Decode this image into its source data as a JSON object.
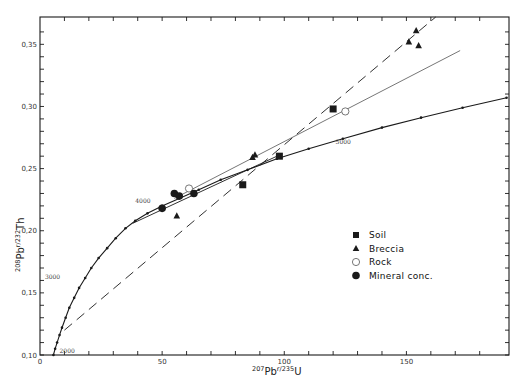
{
  "chart_data": {
    "type": "scatter",
    "title": "",
    "xlabel": "207Pb r/235U",
    "xlabel_parts": {
      "sup1": "207",
      "base1": "Pb",
      "sup2": "r",
      "sep": "/",
      "sup3": "235",
      "base2": "U"
    },
    "ylabel": "208Pb r/232Th",
    "ylabel_parts": {
      "sup1": "208",
      "base1": "Pb",
      "sup2": "r",
      "sep": "/",
      "sup3": "232",
      "base2": "Th"
    },
    "xlim": [
      0,
      192
    ],
    "ylim": [
      0.1,
      0.372
    ],
    "x_ticks": [
      0,
      10,
      20,
      30,
      40,
      50,
      60,
      70,
      80,
      90,
      100,
      110,
      120,
      130,
      140,
      150,
      160,
      170,
      180
    ],
    "x_tick_labels": [
      {
        "value": 0,
        "label": "0"
      },
      {
        "value": 50,
        "label": "50"
      },
      {
        "value": 100,
        "label": "100"
      },
      {
        "value": 150,
        "label": "150"
      }
    ],
    "y_ticks": [
      0.1,
      0.11,
      0.12,
      0.13,
      0.14,
      0.15,
      0.16,
      0.17,
      0.18,
      0.19,
      0.2,
      0.21,
      0.22,
      0.23,
      0.24,
      0.25,
      0.26,
      0.27,
      0.28,
      0.29,
      0.3,
      0.31,
      0.32,
      0.33,
      0.34,
      0.35,
      0.36
    ],
    "y_tick_labels": [
      {
        "value": 0.1,
        "label": "0,10"
      },
      {
        "value": 0.15,
        "label": "0,15"
      },
      {
        "value": 0.2,
        "label": "0,20"
      },
      {
        "value": 0.25,
        "label": "0,25"
      },
      {
        "value": 0.3,
        "label": "0,30"
      },
      {
        "value": 0.35,
        "label": "0,35"
      }
    ],
    "grid": false,
    "legend_position": "right-center",
    "series": [
      {
        "name": "Soil",
        "marker": "filled-square",
        "points": [
          [
            83,
            0.237
          ],
          [
            98,
            0.26
          ],
          [
            120,
            0.298
          ]
        ]
      },
      {
        "name": "Breccia",
        "marker": "filled-triangle",
        "points": [
          [
            151,
            0.352
          ],
          [
            154,
            0.361
          ],
          [
            155,
            0.349
          ],
          [
            87,
            0.259
          ],
          [
            88,
            0.261
          ],
          [
            56,
            0.212
          ]
        ]
      },
      {
        "name": "Rock",
        "marker": "open-circle",
        "points": [
          [
            125,
            0.296
          ],
          [
            61,
            0.234
          ]
        ]
      },
      {
        "name": "Mineral conc.",
        "marker": "filled-circle",
        "points": [
          [
            50,
            0.218
          ],
          [
            55,
            0.23
          ],
          [
            63,
            0.23
          ],
          [
            57,
            0.228
          ]
        ]
      }
    ],
    "concordia": {
      "name": "Concordia curve",
      "style": "solid-with-dots",
      "points": [
        [
          5.5,
          0.1
        ],
        [
          6.2,
          0.105
        ],
        [
          7,
          0.11
        ],
        [
          8,
          0.116
        ],
        [
          9,
          0.122
        ],
        [
          10.5,
          0.13
        ],
        [
          12,
          0.138
        ],
        [
          14,
          0.146
        ],
        [
          16,
          0.154
        ],
        [
          18.5,
          0.162
        ],
        [
          21,
          0.17
        ],
        [
          24,
          0.178
        ],
        [
          27.5,
          0.186
        ],
        [
          31,
          0.194
        ],
        [
          35,
          0.202
        ],
        [
          39,
          0.208
        ],
        [
          44,
          0.214
        ],
        [
          50,
          0.22
        ],
        [
          57,
          0.226
        ],
        [
          65,
          0.233
        ],
        [
          74,
          0.241
        ],
        [
          85,
          0.249
        ],
        [
          97,
          0.258
        ],
        [
          110,
          0.266
        ],
        [
          124,
          0.274
        ],
        [
          140,
          0.283
        ],
        [
          156,
          0.291
        ],
        [
          173,
          0.299
        ],
        [
          191,
          0.307
        ]
      ],
      "age_labels": [
        {
          "label": "2000",
          "x": 8,
          "y": 0.102
        },
        {
          "label": "3000",
          "x": 2,
          "y": 0.161
        },
        {
          "label": "4000",
          "x": 39,
          "y": 0.222
        },
        {
          "label": "5000",
          "x": 121,
          "y": 0.27
        }
      ]
    },
    "fit_lines": [
      {
        "name": "Dashed line (Soil/Breccia)",
        "style": "long-dash",
        "from": [
          10,
          0.12
        ],
        "to": [
          162,
          0.372
        ]
      },
      {
        "name": "Thin line (Rock)",
        "style": "solid-thin",
        "from": [
          55,
          0.226
        ],
        "to": [
          172,
          0.345
        ]
      },
      {
        "name": "Mineral conc. line",
        "style": "solid",
        "from": [
          38,
          0.206
        ],
        "to": [
          97,
          0.26
        ]
      }
    ]
  },
  "legend": {
    "items": [
      {
        "label": "Soil",
        "marker": "filled-square"
      },
      {
        "label": "Breccia",
        "marker": "filled-triangle"
      },
      {
        "label": "Rock",
        "marker": "open-circle"
      },
      {
        "label": "Mineral conc.",
        "marker": "filled-circle"
      }
    ]
  },
  "style": {
    "ink": "#1a1a1a",
    "background": "#ffffff"
  }
}
